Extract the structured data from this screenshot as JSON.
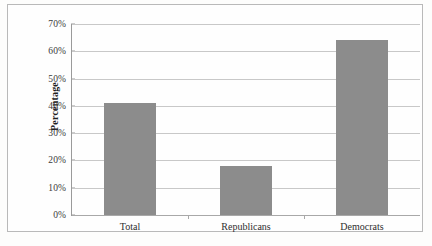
{
  "chart_data": {
    "type": "bar",
    "title": "",
    "xlabel": "",
    "ylabel": "Percentage",
    "categories": [
      "Total",
      "Republicans",
      "Democrats"
    ],
    "values": [
      41,
      18,
      64
    ],
    "ylim": [
      0,
      70
    ],
    "ytick_step": 10,
    "ytick_labels": [
      "0%",
      "10%",
      "20%",
      "30%",
      "40%",
      "50%",
      "60%",
      "70%"
    ],
    "ytick_values": [
      0,
      10,
      20,
      30,
      40,
      50,
      60,
      70
    ],
    "grid": true,
    "legend": false,
    "series": [
      {
        "name": "Percentage",
        "values": [
          41,
          18,
          64
        ]
      }
    ]
  },
  "style": {
    "bar_color": "#8c8c8c",
    "grid_color": "#c8c8c8",
    "axis_color": "#9a9a9a",
    "frame_color": "#b9b9b9",
    "background": "#fefefe",
    "text_color": "#2e2e2e"
  }
}
